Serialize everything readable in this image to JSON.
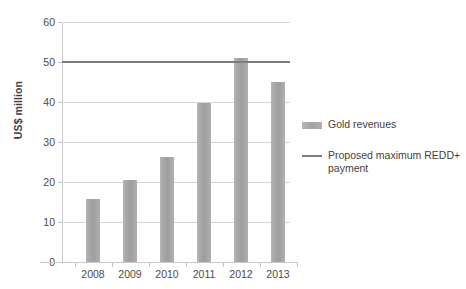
{
  "chart_data": {
    "type": "bar",
    "title": "",
    "xlabel": "",
    "ylabel": "US$ million",
    "categories": [
      "2008",
      "2009",
      "2010",
      "2011",
      "2012",
      "2013"
    ],
    "series": [
      {
        "name": "Gold revenues",
        "type": "bar",
        "values": [
          15.8,
          20.6,
          26.2,
          39.8,
          51.0,
          45.0
        ],
        "color": "#a8a8a8"
      },
      {
        "name": "Proposed maximum REDD+ payment",
        "type": "line",
        "constant_value": 50,
        "values": [
          50,
          50,
          50,
          50,
          50,
          50
        ],
        "color": "#7d7d7d"
      }
    ],
    "ylim": [
      0,
      60
    ],
    "yticks": [
      0,
      10,
      20,
      30,
      40,
      50,
      60
    ],
    "ytick_labels": [
      "0",
      "10",
      "20",
      "30",
      "40",
      "50",
      "60"
    ],
    "grid": true,
    "legend_position": "right"
  },
  "legend": {
    "entries": [
      {
        "label": "Gold revenues",
        "marker": "bar-swatch-icon"
      },
      {
        "label": "Proposed maximum REDD+ payment",
        "marker": "line-swatch-icon"
      }
    ]
  }
}
